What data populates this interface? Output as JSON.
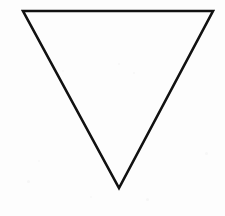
{
  "canvas": {
    "width": 225,
    "height": 216,
    "background_color": "#fdfdfd",
    "title": "Downward-pointing triangle line drawing"
  },
  "shape": {
    "name": "triangle",
    "orientation": "point-down",
    "description": "Inverted isosceles triangle outline",
    "stroke_color": "#111111",
    "fill_color": "none",
    "stroke_width": 2.6,
    "stroke_linejoin": "miter",
    "points": "23,11 213,11 119,188",
    "vertices": [
      {
        "label": "top-left",
        "x": 23,
        "y": 11
      },
      {
        "label": "top-right",
        "x": 213,
        "y": 11
      },
      {
        "label": "bottom-apex",
        "x": 119,
        "y": 188
      }
    ]
  },
  "artifacts": {
    "specks": [
      {
        "x": 118,
        "y": 63,
        "size": 2,
        "color": "#f6f6f6"
      },
      {
        "x": 62,
        "y": 70,
        "size": 2,
        "color": "#f7f7f7"
      },
      {
        "x": 133,
        "y": 72,
        "size": 2,
        "color": "#f6f6f6"
      },
      {
        "x": 38,
        "y": 160,
        "size": 2,
        "color": "#f7f7f7"
      },
      {
        "x": 27,
        "y": 180,
        "size": 3,
        "color": "#f6f6f6"
      },
      {
        "x": 146,
        "y": 198,
        "size": 3,
        "color": "#f6f6f6"
      },
      {
        "x": 90,
        "y": 196,
        "size": 2,
        "color": "#f7f7f7"
      },
      {
        "x": 205,
        "y": 152,
        "size": 3,
        "color": "#f7f7f7"
      }
    ]
  }
}
